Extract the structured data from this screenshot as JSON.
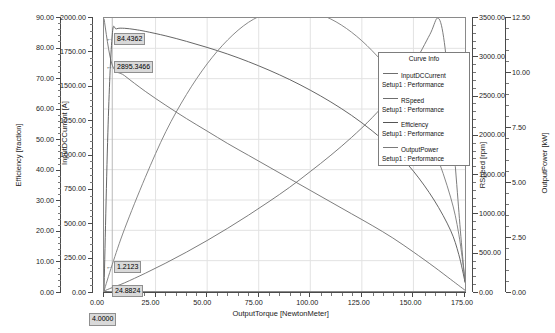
{
  "chart_data": {
    "type": "line",
    "title": "",
    "xlabel": "OutputTorque [NewtonMeter]",
    "xlim": [
      0,
      175
    ],
    "xticks": [
      "0.00",
      "25.00",
      "50.00",
      "75.00",
      "100.00",
      "125.00",
      "150.00",
      "175.00"
    ],
    "grid": true,
    "legend_position": "inside-right",
    "axes": [
      {
        "id": "efficiency",
        "label": "Efficiency [fraction]",
        "side": "left",
        "lim": [
          0,
          90
        ],
        "ticks": [
          "0.00",
          "10.00",
          "20.00",
          "30.00",
          "40.00",
          "50.00",
          "60.00",
          "70.00",
          "80.00",
          "90.00"
        ]
      },
      {
        "id": "current",
        "label": "InputDCCurrent [A]",
        "side": "left",
        "lim": [
          0,
          2000
        ],
        "ticks": [
          "0.00",
          "250.00",
          "500.00",
          "750.00",
          "1000.00",
          "1250.00",
          "1500.00",
          "1750.00",
          "2000.00"
        ]
      },
      {
        "id": "speed",
        "label": "RSpeed [rpm]",
        "side": "right",
        "lim": [
          0,
          3500
        ],
        "ticks": [
          "0.00",
          "500.00",
          "1000.00",
          "1500.00",
          "2000.00",
          "2500.00",
          "3000.00",
          "3500.00"
        ]
      },
      {
        "id": "power",
        "label": "OutputPower [kW]",
        "side": "right",
        "lim": [
          0,
          12.5
        ],
        "ticks": [
          "0.00",
          "2.50",
          "5.00",
          "7.50",
          "10.00",
          "12.50"
        ]
      }
    ],
    "series": [
      {
        "name": "InputDCCurrent",
        "axis": "current",
        "color": "#6e6e6e",
        "x": [
          0,
          4,
          10,
          20,
          30,
          40,
          50,
          60,
          70,
          80,
          90,
          100,
          110,
          120,
          130,
          140,
          150,
          158,
          162,
          165,
          168,
          171,
          173,
          175
        ],
        "y": [
          0,
          24.88,
          60,
          130,
          205,
          285,
          370,
          460,
          555,
          655,
          760,
          875,
          995,
          1125,
          1270,
          1440,
          1660,
          1880,
          2000,
          1820,
          1350,
          780,
          400,
          60
        ]
      },
      {
        "name": "RSpeed",
        "axis": "speed",
        "color": "#6e6e6e",
        "x": [
          0,
          4,
          10,
          20,
          30,
          40,
          50,
          60,
          70,
          80,
          90,
          100,
          110,
          120,
          130,
          140,
          150,
          160,
          168,
          172,
          175
        ],
        "y": [
          3490,
          2895.35,
          2760,
          2560,
          2380,
          2210,
          2050,
          1890,
          1740,
          1590,
          1440,
          1290,
          1140,
          990,
          840,
          680,
          500,
          310,
          150,
          70,
          10
        ]
      },
      {
        "name": "Efficiency",
        "axis": "efficiency",
        "color": "#555555",
        "x": [
          0,
          2,
          4,
          6,
          10,
          15,
          20,
          30,
          40,
          50,
          60,
          70,
          80,
          90,
          100,
          110,
          120,
          130,
          140,
          150,
          160,
          168,
          172,
          175
        ],
        "y": [
          0,
          55,
          84.44,
          86.4,
          86.6,
          86.2,
          85.6,
          84.1,
          82.3,
          80.3,
          78.1,
          75.6,
          72.8,
          69.7,
          66.2,
          62.3,
          57.9,
          52.8,
          46.8,
          39.5,
          30.0,
          20.0,
          12.0,
          3.0
        ]
      },
      {
        "name": "OutputPower",
        "axis": "power",
        "color": "#7a7a7a",
        "x": [
          0,
          4,
          10,
          20,
          30,
          40,
          50,
          60,
          70,
          80,
          90,
          100,
          110,
          120,
          130,
          140,
          150,
          160,
          168,
          172,
          175
        ],
        "y": [
          0,
          1.2123,
          2.85,
          5.2,
          7.3,
          9.0,
          10.4,
          11.5,
          12.3,
          12.75,
          12.9,
          12.8,
          12.45,
          11.85,
          11.0,
          9.9,
          8.4,
          6.5,
          4.3,
          2.6,
          0.5
        ]
      }
    ],
    "annotations": [
      {
        "name": "efficiency-marker",
        "text": "84.4362",
        "x": 4,
        "series": "Efficiency"
      },
      {
        "name": "speed-marker",
        "text": "2895.3466",
        "x": 4,
        "series": "RSpeed"
      },
      {
        "name": "power-marker",
        "text": "1.2123",
        "x": 4,
        "series": "OutputPower"
      },
      {
        "name": "current-marker",
        "text": "24.8824",
        "x": 4,
        "series": "InputDCCurrent"
      },
      {
        "name": "cursor-x-marker",
        "text": "4.0000",
        "x": 4,
        "series": "x-axis"
      }
    ]
  },
  "legend": {
    "title": "Curve Info",
    "entries": [
      {
        "name": "InputDCCurrent",
        "setup": "Setup1 : Performance"
      },
      {
        "name": "RSpeed",
        "setup": "Setup1 : Performance"
      },
      {
        "name": "Efficiency",
        "setup": "Setup1 : Performance"
      },
      {
        "name": "OutputPower",
        "setup": "Setup1 : Performance"
      }
    ]
  },
  "colors": {
    "background": "#ffffff",
    "grid": "#e2e2e2",
    "axis": "#4a4a4a",
    "label_bg": "#d9d9d9"
  }
}
